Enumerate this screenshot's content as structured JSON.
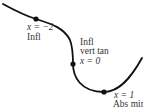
{
  "diagram": {
    "type": "function-curve-sketch",
    "curve_color": "#111111",
    "point_color": "#111111",
    "points": [
      {
        "id": "x-neg2",
        "x_label": "x = −2",
        "label_lines": [
          "Infl"
        ]
      },
      {
        "id": "x-0",
        "x_label": "x = 0",
        "label_lines": [
          "Infl",
          "vert tan"
        ]
      },
      {
        "id": "x-1",
        "x_label": "x = 1",
        "label_lines": [
          "Abs min"
        ]
      }
    ]
  }
}
